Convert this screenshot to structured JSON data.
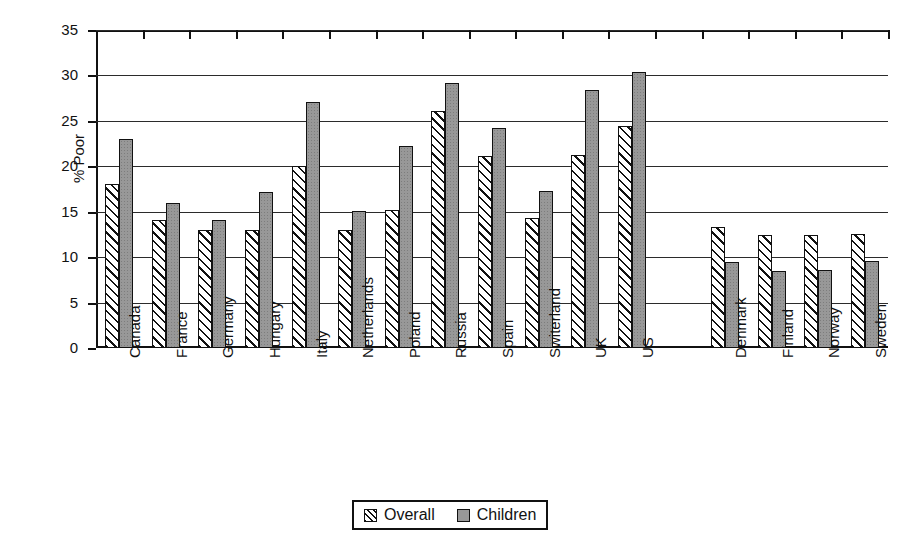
{
  "chart_data": {
    "type": "bar",
    "title": "",
    "xlabel": "",
    "ylabel": "% Poor",
    "ylim": [
      0,
      35
    ],
    "yticks": [
      0,
      5,
      10,
      15,
      20,
      25,
      30,
      35
    ],
    "grid": true,
    "legend_position": "bottom",
    "categories": [
      "Canada",
      "France",
      "Germany",
      "Hungary",
      "Italy",
      "Netherlands",
      "Poland",
      "Russia",
      "Spain",
      "Switerland",
      "UK",
      "US",
      "",
      "Denmark",
      "Finland",
      "Norway",
      "Sweden"
    ],
    "series": [
      {
        "name": "Overall",
        "values": [
          18.1,
          14.1,
          13.0,
          13.0,
          20.0,
          13.0,
          15.2,
          26.1,
          21.1,
          14.3,
          21.2,
          24.4,
          null,
          13.3,
          12.4,
          12.4,
          12.5
        ]
      },
      {
        "name": "Children",
        "values": [
          23.0,
          16.0,
          14.1,
          17.2,
          27.1,
          15.1,
          22.2,
          29.2,
          24.2,
          17.3,
          28.4,
          30.4,
          null,
          9.5,
          8.5,
          8.6,
          9.6
        ]
      }
    ],
    "gap_after_index": 11,
    "colors": {
      "overall_fill": "#ffffff",
      "overall_hatch": "#111111",
      "children_fill": "#989898",
      "axis": "#111111",
      "grid": "#2b2b2b"
    }
  },
  "legend": {
    "items": [
      {
        "label": "Overall",
        "swatch": "hatched-swatch"
      },
      {
        "label": "Children",
        "swatch": "gray-swatch"
      }
    ]
  }
}
